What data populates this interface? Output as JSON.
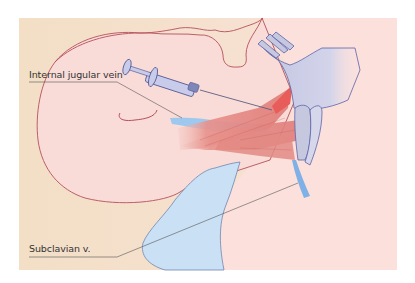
{
  "figure": {
    "type": "anatomical illustration",
    "colors": {
      "background_tan": "#f3dfc6",
      "skin_pink": "#f9dcd8",
      "outline_red": "#b5505a",
      "vein_blue": "#9ec8ee",
      "vein_blue_light": "#c9e0f5",
      "muscle_red": "#e58a86",
      "bone_grey": "#c6c8e0",
      "bone_outline": "#5c62a8",
      "leader_line": "#555555"
    }
  },
  "labels": {
    "internal_jugular_vein": "Internal jugular vein",
    "subclavian_vein": "Subclavian v."
  }
}
